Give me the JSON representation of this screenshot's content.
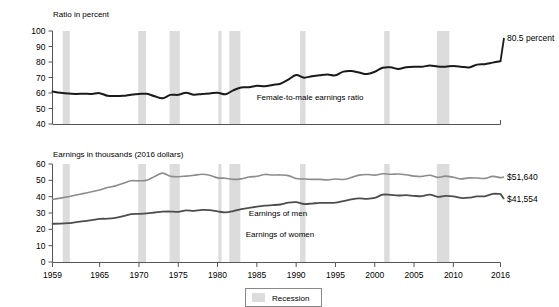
{
  "chart_data": {
    "type": "line",
    "title": "",
    "panels": [
      {
        "id": "ratio-panel",
        "ylabel": "Ratio in percent",
        "ylim": [
          40,
          100
        ],
        "yticks": [
          40,
          50,
          60,
          70,
          80,
          90,
          100
        ],
        "ytick_labels": [
          "40",
          "50",
          "60",
          "70",
          "80",
          "90",
          "100"
        ],
        "grid": false,
        "series": [
          {
            "name": "Female-to-male earnings ratio",
            "label_text": "Female-to-male earnings ratio",
            "end_label": "80.5 percent",
            "color": "#1a1a1a",
            "x": [
              1959,
              1960,
              1961,
              1962,
              1963,
              1964,
              1965,
              1966,
              1967,
              1968,
              1969,
              1970,
              1971,
              1972,
              1973,
              1974,
              1975,
              1976,
              1977,
              1978,
              1979,
              1980,
              1981,
              1982,
              1983,
              1984,
              1985,
              1986,
              1987,
              1988,
              1989,
              1990,
              1991,
              1992,
              1993,
              1994,
              1995,
              1996,
              1997,
              1998,
              1999,
              2000,
              2001,
              2002,
              2003,
              2004,
              2005,
              2006,
              2007,
              2008,
              2009,
              2010,
              2011,
              2012,
              2013,
              2014,
              2015,
              2016
            ],
            "values": [
              61.0,
              60.2,
              59.6,
              59.4,
              59.5,
              59.4,
              59.9,
              58.2,
              58.0,
              58.2,
              58.9,
              59.4,
              59.5,
              57.9,
              56.6,
              58.8,
              58.8,
              60.2,
              58.9,
              59.4,
              59.7,
              60.2,
              59.2,
              61.7,
              63.6,
              63.7,
              64.6,
              64.3,
              65.2,
              66.0,
              68.7,
              71.6,
              69.9,
              70.8,
              71.5,
              72.0,
              71.4,
              73.8,
              74.2,
              73.2,
              72.2,
              73.7,
              76.3,
              76.6,
              75.5,
              76.6,
              77.0,
              76.9,
              77.8,
              77.1,
              77.0,
              77.4,
              77.0,
              76.5,
              78.3,
              78.6,
              79.6,
              80.5
            ]
          }
        ]
      },
      {
        "id": "earnings-panel",
        "ylabel": "Earnings in thousands (2016 dollars)",
        "ylim": [
          0,
          60
        ],
        "yticks": [
          0,
          10,
          20,
          30,
          40,
          50,
          60
        ],
        "ytick_labels": [
          "0",
          "10",
          "20",
          "30",
          "40",
          "50",
          "60"
        ],
        "grid": false,
        "series": [
          {
            "name": "Earnings of men",
            "label_text": "Earnings of men",
            "end_label": "$51,640",
            "color": "#8c8c8c",
            "x": [
              1959,
              1960,
              1961,
              1962,
              1963,
              1964,
              1965,
              1966,
              1967,
              1968,
              1969,
              1970,
              1971,
              1972,
              1973,
              1974,
              1975,
              1976,
              1977,
              1978,
              1979,
              1980,
              1981,
              1982,
              1983,
              1984,
              1985,
              1986,
              1987,
              1988,
              1989,
              1990,
              1991,
              1992,
              1993,
              1994,
              1995,
              1996,
              1997,
              1998,
              1999,
              2000,
              2001,
              2002,
              2003,
              2004,
              2005,
              2006,
              2007,
              2008,
              2009,
              2010,
              2011,
              2012,
              2013,
              2014,
              2015,
              2016
            ],
            "values": [
              38.3,
              39.1,
              40.0,
              41.0,
              42.0,
              43.0,
              44.1,
              45.6,
              46.6,
              48.2,
              49.7,
              49.7,
              50.0,
              52.4,
              54.4,
              52.5,
              52.2,
              52.6,
              53.1,
              53.7,
              53.1,
              51.5,
              51.3,
              50.6,
              50.9,
              52.0,
              52.5,
              53.6,
              53.3,
              53.3,
              52.9,
              51.1,
              50.8,
              50.6,
              50.6,
              50.3,
              50.8,
              50.5,
              51.7,
              53.2,
              53.6,
              53.2,
              54.0,
              53.7,
              53.9,
              53.4,
              52.6,
              52.4,
              53.1,
              51.8,
              52.6,
              51.9,
              50.9,
              51.5,
              51.4,
              51.2,
              52.4,
              51.6
            ]
          },
          {
            "name": "Earnings of women",
            "label_text": "Earnings of women",
            "end_label": "$41,554",
            "color": "#4d4d4d",
            "x": [
              1959,
              1960,
              1961,
              1962,
              1963,
              1964,
              1965,
              1966,
              1967,
              1968,
              1969,
              1970,
              1971,
              1972,
              1973,
              1974,
              1975,
              1976,
              1977,
              1978,
              1979,
              1980,
              1981,
              1982,
              1983,
              1984,
              1985,
              1986,
              1987,
              1988,
              1989,
              1990,
              1991,
              1992,
              1993,
              1994,
              1995,
              1996,
              1997,
              1998,
              1999,
              2000,
              2001,
              2002,
              2003,
              2004,
              2005,
              2006,
              2007,
              2008,
              2009,
              2010,
              2011,
              2012,
              2013,
              2014,
              2015,
              2016
            ],
            "values": [
              23.4,
              23.5,
              23.8,
              24.4,
              25.0,
              25.6,
              26.4,
              26.5,
              27.0,
              28.1,
              29.3,
              29.5,
              29.8,
              30.3,
              30.8,
              30.9,
              30.7,
              31.6,
              31.3,
              31.9,
              31.7,
              31.0,
              30.4,
              31.2,
              32.4,
              33.1,
              33.9,
              34.5,
              34.8,
              35.2,
              36.3,
              36.6,
              35.5,
              35.8,
              36.2,
              36.2,
              36.3,
              37.3,
              38.3,
              38.9,
              38.7,
              39.2,
              41.2,
              41.1,
              40.7,
              40.9,
              40.5,
              40.3,
              41.3,
              39.9,
              40.5,
              40.2,
              39.2,
              39.4,
              40.2,
              40.2,
              41.7,
              41.6
            ]
          }
        ]
      }
    ],
    "xlabel": "",
    "xlim": [
      1959,
      2016
    ],
    "xticks": [
      1959,
      1965,
      1970,
      1975,
      1980,
      1985,
      1990,
      1995,
      2000,
      2005,
      2010,
      2016
    ],
    "xtick_labels": [
      "1959",
      "1965",
      "1970",
      "1975",
      "1980",
      "1985",
      "1990",
      "1995",
      "2000",
      "2005",
      "2010",
      "2016"
    ],
    "recessions": [
      {
        "start": 1960.3,
        "end": 1961.2
      },
      {
        "start": 1969.9,
        "end": 1970.9
      },
      {
        "start": 1973.9,
        "end": 1975.2
      },
      {
        "start": 1980.1,
        "end": 1980.5
      },
      {
        "start": 1981.5,
        "end": 1982.9
      },
      {
        "start": 1990.5,
        "end": 1991.2
      },
      {
        "start": 2001.2,
        "end": 2001.9
      },
      {
        "start": 2007.9,
        "end": 2009.5
      }
    ],
    "recession_color": "#dcdcdc",
    "legend": {
      "position": "bottom-center",
      "entries": [
        {
          "label": "Recession",
          "color": "#dcdcdc",
          "swatch": "band"
        }
      ]
    }
  },
  "panel_top": {
    "axis_title": "Ratio in percent",
    "ytick_labels": [
      "100",
      "90",
      "80",
      "70",
      "60",
      "50",
      "40"
    ],
    "series_label": "Female-to-male earnings ratio",
    "end_label": "80.5 percent"
  },
  "panel_bottom": {
    "axis_title": "Earnings in thousands (2016 dollars)",
    "ytick_labels": [
      "60",
      "50",
      "40",
      "30",
      "20",
      "10",
      "0"
    ],
    "series_label_men": "Earnings of men",
    "series_label_women": "Earnings of women",
    "end_label_men": "$51,640",
    "end_label_women": "$41,554"
  },
  "xaxis": {
    "labels": [
      "1959",
      "1965",
      "1970",
      "1975",
      "1980",
      "1985",
      "1990",
      "1995",
      "2000",
      "2005",
      "2010",
      "2016"
    ]
  },
  "legend": {
    "recession_label": "Recession"
  }
}
